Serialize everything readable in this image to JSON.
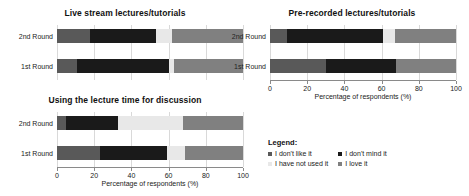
{
  "chart_data": [
    {
      "id": "live-stream",
      "type": "bar",
      "orientation": "horizontal",
      "stacked": true,
      "title": "Live stream lectures/tutorials",
      "xlabel": "",
      "ylabel": "",
      "xlim": [
        0,
        100
      ],
      "categories": [
        "2nd Round",
        "1st Round"
      ],
      "grid": true,
      "show_axis": false,
      "series": [
        {
          "name": "I don't like it",
          "color": "#595959",
          "values": [
            18,
            11
          ]
        },
        {
          "name": "I don't mind it",
          "color": "#1a1a1a",
          "values": [
            35,
            49
          ]
        },
        {
          "name": "I have not used it",
          "color": "#e8e8e8",
          "values": [
            9,
            3
          ]
        },
        {
          "name": "I love it",
          "color": "#808080",
          "values": [
            38,
            37
          ]
        }
      ]
    },
    {
      "id": "pre-recorded",
      "type": "bar",
      "orientation": "horizontal",
      "stacked": true,
      "title": "Pre-recorded lectures/tutorials",
      "xlabel": "Percentage of respondents (%)",
      "ylabel": "",
      "xlim": [
        0,
        100
      ],
      "categories": [
        "2nd Round",
        "1st Round"
      ],
      "grid": true,
      "show_axis": true,
      "xticks": [
        0,
        20,
        40,
        60,
        80,
        100
      ],
      "series": [
        {
          "name": "I don't like it",
          "color": "#595959",
          "values": [
            9,
            30
          ]
        },
        {
          "name": "I don't mind it",
          "color": "#1a1a1a",
          "values": [
            52,
            38
          ]
        },
        {
          "name": "I have not used it",
          "color": "#e8e8e8",
          "values": [
            6,
            0
          ]
        },
        {
          "name": "I love it",
          "color": "#808080",
          "values": [
            33,
            32
          ]
        }
      ]
    },
    {
      "id": "discussion",
      "type": "bar",
      "orientation": "horizontal",
      "stacked": true,
      "title": "Using the lecture time for discussion",
      "xlabel": "Percentage of respondents (%)",
      "ylabel": "",
      "xlim": [
        0,
        100
      ],
      "categories": [
        "2nd Round",
        "1st Round"
      ],
      "grid": true,
      "show_axis": true,
      "xticks": [
        0,
        20,
        40,
        60,
        80,
        100
      ],
      "series": [
        {
          "name": "I don't like it",
          "color": "#595959",
          "values": [
            5,
            23
          ]
        },
        {
          "name": "I don't mind it",
          "color": "#1a1a1a",
          "values": [
            28,
            36
          ]
        },
        {
          "name": "I have not used it",
          "color": "#e8e8e8",
          "values": [
            35,
            10
          ]
        },
        {
          "name": "I love it",
          "color": "#808080",
          "values": [
            32,
            31
          ]
        }
      ]
    }
  ],
  "charts": {
    "live_stream": {
      "title": "Live stream lectures/tutorials",
      "rows": [
        "2nd Round",
        "1st Round"
      ]
    },
    "pre_recorded": {
      "title": "Pre-recorded lectures/tutorials",
      "rows": [
        "2nd Round",
        "1st Round"
      ],
      "xlabel": "Percentage of respondents (%)",
      "ticks": [
        "0",
        "20",
        "40",
        "60",
        "80",
        "100"
      ]
    },
    "discussion": {
      "title": "Using the lecture time for discussion",
      "rows": [
        "2nd Round",
        "1st Round"
      ],
      "xlabel": "Percentage of respondents (%)",
      "ticks": [
        "0",
        "20",
        "40",
        "60",
        "80",
        "100"
      ]
    }
  },
  "legend": {
    "title": "Legend:",
    "items": [
      {
        "label": "I don't like it",
        "color": "#595959"
      },
      {
        "label": "I don't mind it",
        "color": "#1a1a1a"
      },
      {
        "label": "I have not used it",
        "color": "#e8e8e8"
      },
      {
        "label": "I love it",
        "color": "#808080"
      }
    ]
  },
  "colors": {
    "dont_like": "#595959",
    "dont_mind": "#1a1a1a",
    "not_used": "#e8e8e8",
    "love": "#808080",
    "grid": "#d9d9d9",
    "axis": "#8a8a8a",
    "background": "#ffffff"
  }
}
